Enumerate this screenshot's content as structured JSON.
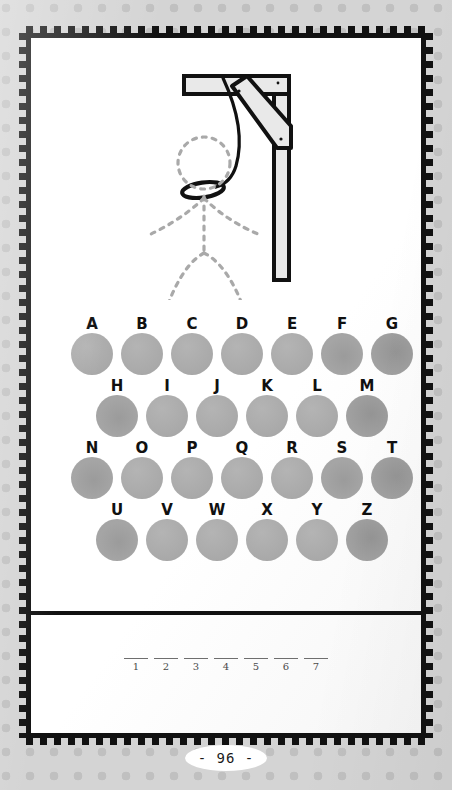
{
  "page": {
    "kind": "hangman-puzzle-page",
    "page_number_label": "- 96 -",
    "background_color": "#d4d4d4",
    "dot_color": "#c0c0c0",
    "frame_color": "#111111",
    "card_color": "#ffffff"
  },
  "gallows": {
    "title": "hangman-gallows-drawing",
    "post_color": "#e8e8e8",
    "outline_color": "#111111",
    "figure_color": "#a9a9a9",
    "figure_style": "dashed",
    "noose_color": "#111111",
    "parts_drawn": [
      "beam",
      "post",
      "brace",
      "rope",
      "noose"
    ],
    "figure_parts_dashed": [
      "head",
      "body",
      "left-arm",
      "right-arm",
      "left-leg",
      "right-leg"
    ]
  },
  "keypad": {
    "dot_color": "#adadad",
    "rows": [
      {
        "name": "row-a",
        "letters": [
          "A",
          "B",
          "C",
          "D",
          "E",
          "F",
          "G"
        ]
      },
      {
        "name": "row-b",
        "letters": [
          "H",
          "I",
          "J",
          "K",
          "L",
          "M"
        ]
      },
      {
        "name": "row-c",
        "letters": [
          "N",
          "O",
          "P",
          "Q",
          "R",
          "S",
          "T"
        ]
      },
      {
        "name": "row-d",
        "letters": [
          "U",
          "V",
          "W",
          "X",
          "Y",
          "Z"
        ]
      }
    ]
  },
  "answer": {
    "blank_count": 7,
    "numbers": [
      "1",
      "2",
      "3",
      "4",
      "5",
      "6",
      "7"
    ],
    "rule_color": "#6e6e6e"
  }
}
